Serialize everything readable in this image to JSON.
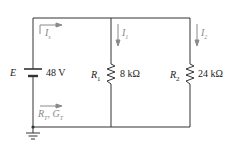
{
  "source": {
    "label": "E",
    "value": "48 V"
  },
  "resistors": [
    {
      "label": "R",
      "sub": "1",
      "value": "8 kΩ"
    },
    {
      "label": "R",
      "sub": "2",
      "value": "24 kΩ"
    }
  ],
  "currents": {
    "total": {
      "label": "I",
      "sub": "s"
    },
    "branch1": {
      "label": "I",
      "sub": "1"
    },
    "branch2": {
      "label": "I",
      "sub": "2"
    }
  },
  "equivalent": {
    "label": "R",
    "sub1": "T",
    "sep": ", ",
    "label2": "G",
    "sub2": "T"
  },
  "colors": {
    "wire": "#333333",
    "annotation": "#8a8a8a"
  }
}
